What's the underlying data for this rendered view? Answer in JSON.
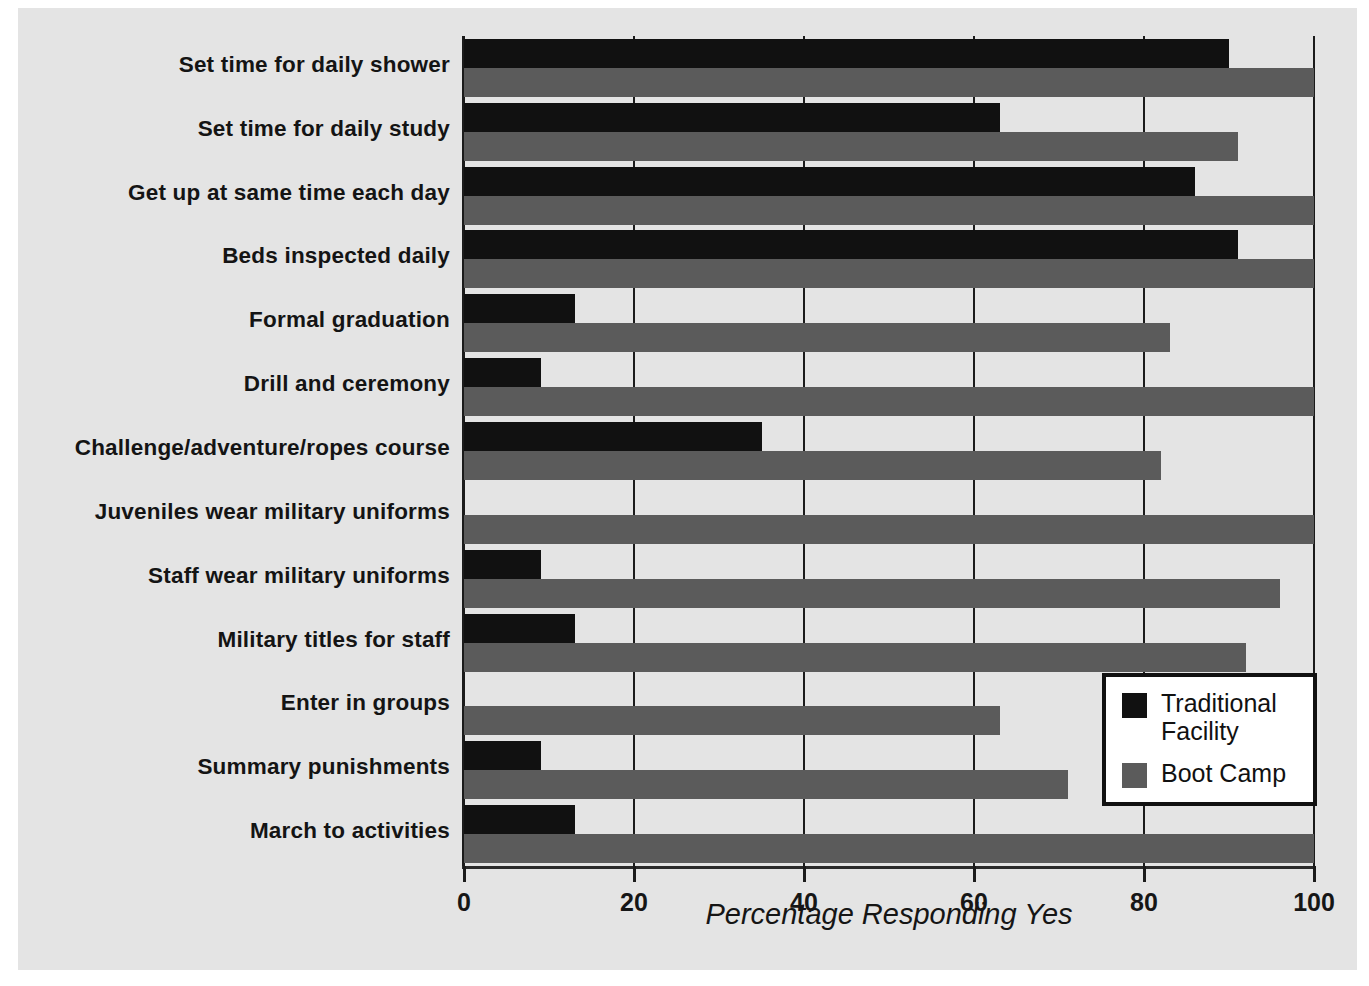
{
  "chart_data": {
    "type": "bar",
    "orientation": "horizontal",
    "title": "",
    "xlabel": "Percentage Responding Yes",
    "ylabel": "",
    "xlim": [
      0,
      100
    ],
    "xticks": [
      0,
      20,
      40,
      60,
      80,
      100
    ],
    "grid": "vertical",
    "legend_position": "inside-bottom-right",
    "categories": [
      "Set time for daily shower",
      "Set time for daily study",
      "Get up at same time each day",
      "Beds inspected daily",
      "Formal graduation",
      "Drill and ceremony",
      "Challenge/adventure/ropes course",
      "Juveniles wear military uniforms",
      "Staff wear military uniforms",
      "Military titles for staff",
      "Enter in groups",
      "Summary punishments",
      "March to activities"
    ],
    "series": [
      {
        "name": "Traditional Facility",
        "color": "#111111",
        "values": [
          90,
          63,
          86,
          91,
          13,
          9,
          35,
          0,
          9,
          13,
          0,
          9,
          13
        ]
      },
      {
        "name": "Boot Camp",
        "color": "#5b5b5b",
        "values": [
          100,
          91,
          100,
          100,
          83,
          100,
          82,
          100,
          96,
          92,
          63,
          71,
          100
        ]
      }
    ]
  },
  "legend": {
    "items": [
      {
        "label": "Traditional\nFacility",
        "color": "#111111"
      },
      {
        "label": "Boot Camp",
        "color": "#5b5b5b"
      }
    ]
  },
  "axis": {
    "tick_labels": [
      "0",
      "20",
      "40",
      "60",
      "80",
      "100"
    ],
    "x_title": "Percentage Responding Yes"
  }
}
